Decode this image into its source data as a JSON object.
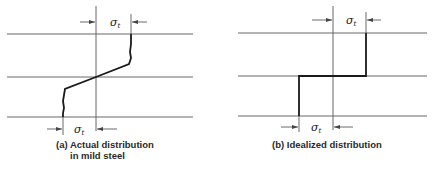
{
  "figures": [
    {
      "id": "a",
      "caption_line1": "(a) Actual distribution",
      "caption_line2": "in mild steel",
      "top_label": {
        "symbol": "σ",
        "subscript": "t"
      },
      "bottom_label": {
        "symbol": "σ",
        "subscript": "t"
      },
      "description": "Stress distribution with yielded flanges; near-constant stress in outer regions with linear transition through neutral axis"
    },
    {
      "id": "b",
      "caption_line1": "(b) Idealized distribution",
      "top_label": {
        "symbol": "σ",
        "subscript": "t"
      },
      "bottom_label": {
        "symbol": "σ",
        "subscript": "t"
      },
      "description": "Rectangular (fully plastic) stress block, tension above and compression below neutral axis"
    }
  ],
  "colors": {
    "line": "#555555",
    "stress": "#1a1a1a"
  }
}
